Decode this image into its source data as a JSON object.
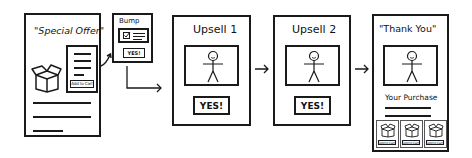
{
  "diagram": {
    "type": "sales-funnel-flow",
    "steps": [
      {
        "id": "special-offer",
        "title": "\"Special Offer\"",
        "add_to_cart_label": "Add to Cart"
      },
      {
        "id": "bump",
        "title": "Bump",
        "button_label": "YES!"
      },
      {
        "id": "upsell-1",
        "title": "Upsell 1",
        "button_label": "YES!"
      },
      {
        "id": "upsell-2",
        "title": "Upsell 2",
        "button_label": "YES!"
      },
      {
        "id": "thank-you",
        "title": "\"Thank You\"",
        "subtitle": "Your Purchase",
        "product_labels": [
          "Add to Cart",
          "Add to Cart",
          "Add to Cart"
        ]
      }
    ],
    "edges": [
      {
        "from": "special-offer",
        "to": "bump"
      },
      {
        "from": "bump",
        "to": "upsell-1"
      },
      {
        "from": "upsell-1",
        "to": "upsell-2"
      },
      {
        "from": "upsell-2",
        "to": "thank-you"
      }
    ],
    "stroke_color": "#1a1a1a",
    "background_color": "#ffffff"
  }
}
